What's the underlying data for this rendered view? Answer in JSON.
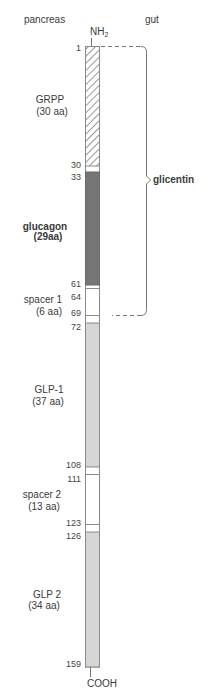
{
  "header": {
    "left_label": "pancreas",
    "right_label": "gut"
  },
  "termini": {
    "n_terminus": {
      "main": "NH",
      "sub": "2"
    },
    "c_terminus": "COOH"
  },
  "segments": [
    {
      "name": "GRPP",
      "length": "(30 aa)",
      "start": 1,
      "end": 30,
      "fill": "hatched"
    },
    {
      "name": "glucagon",
      "length": "(29aa)",
      "start": 33,
      "end": 61,
      "fill": "#767676"
    },
    {
      "name": "spacer 1",
      "length": "(6 aa)",
      "start": 64,
      "end": 69,
      "fill": "#ffffff"
    },
    {
      "name": "GLP-1",
      "length": "(37 aa)",
      "start": 72,
      "end": 108,
      "fill": "#d6d6d6"
    },
    {
      "name": "spacer 2",
      "length": "(13 aa)",
      "start": 111,
      "end": 123,
      "fill": "#ffffff"
    },
    {
      "name": "GLP 2",
      "length": "(34 aa)",
      "start": 126,
      "end": 159,
      "fill": "#d6d6d6"
    }
  ],
  "residue_ticks": [
    "1",
    "30",
    "33",
    "61",
    "64",
    "69",
    "72",
    "108",
    "111",
    "123",
    "126",
    "159"
  ],
  "bracket": {
    "label": "glicentin",
    "from": 1,
    "to": 69
  },
  "colors": {
    "outline": "#8a8a8a",
    "dark": "#767676",
    "light": "#d6d6d6",
    "hatch": "#555555"
  }
}
